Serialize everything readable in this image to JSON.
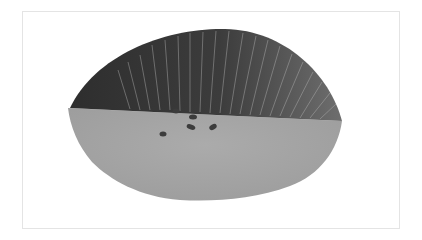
{
  "image": {
    "description": "Photograph of a fractured specimen cross-section: dark, radially striated upper region over a lighter grey granular lower region with several small dark pores near the boundary",
    "colors": {
      "background": "#ffffff",
      "frame_border": "#e4e4e4",
      "upper_region_dark": "#3a3a3a",
      "upper_region_highlight": "#bdbdbd",
      "lower_region": "#a8a8a8",
      "lower_region_shade": "#9a9a9a",
      "pores": "#3c3c3c"
    },
    "regions": [
      {
        "name": "striated-fracture-zone",
        "label": "dark fibrous upper region"
      },
      {
        "name": "granular-fracture-zone",
        "label": "grey granular lower region"
      }
    ],
    "pores": [
      {
        "cx": 176,
        "cy": 111,
        "rx": 3.5,
        "ry": 2.5
      },
      {
        "cx": 193,
        "cy": 117,
        "rx": 4,
        "ry": 2.5
      },
      {
        "cx": 191,
        "cy": 127,
        "rx": 4.5,
        "ry": 2.5
      },
      {
        "cx": 213,
        "cy": 127,
        "rx": 4,
        "ry": 2.5
      },
      {
        "cx": 163,
        "cy": 134,
        "rx": 3.5,
        "ry": 2.5
      }
    ]
  }
}
